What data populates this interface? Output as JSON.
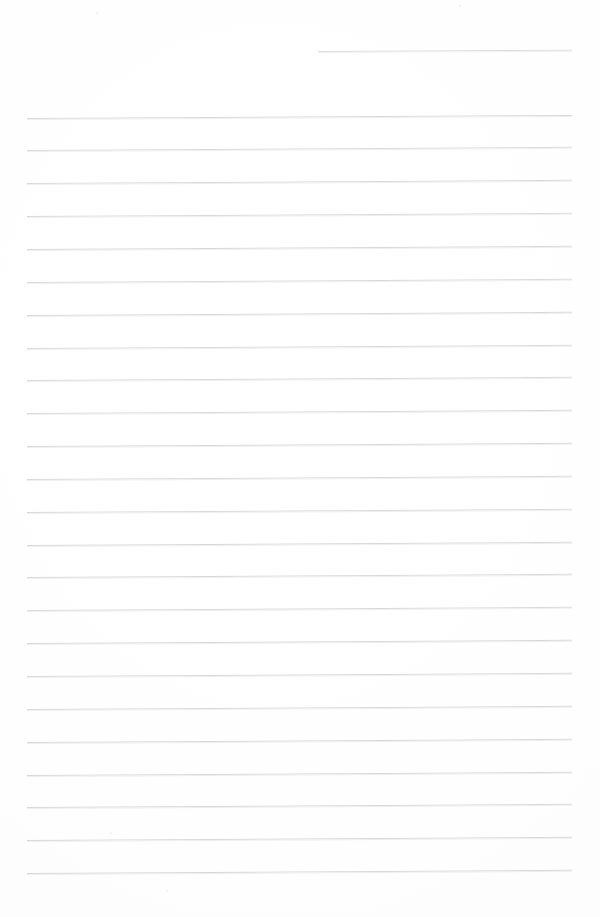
{
  "document": {
    "kind": "scanned-ruled-paper",
    "title": "Blank Ruled Notebook Page",
    "content_text": "",
    "handwriting_present": "no",
    "page_width": 600,
    "page_height": 917,
    "background_color": "#fefefe",
    "rule_color": "#d6d7d9",
    "rule_color_soft": "#eeeef0",
    "rule_thickness_px": 1,
    "rule_spacing_px": 32.85,
    "rule_left_x": 27,
    "rule_right_x": 572,
    "rule_slant_deg": -0.33,
    "full_rule_count": 24,
    "partial_rule_count": 1
  },
  "rules": {
    "partial": [
      {
        "y": 50.5,
        "x": 318,
        "width": 254,
        "slant": -0.3,
        "opacity": 0.85
      }
    ],
    "full": [
      {
        "y": 117.5,
        "x": 27,
        "width": 545,
        "slant": -0.32,
        "opacity": 0.95
      },
      {
        "y": 150.4,
        "x": 27,
        "width": 545,
        "slant": -0.34,
        "opacity": 0.92
      },
      {
        "y": 183.2,
        "x": 27,
        "width": 545,
        "slant": -0.33,
        "opacity": 0.95
      },
      {
        "y": 216.1,
        "x": 27,
        "width": 545,
        "slant": -0.33,
        "opacity": 0.93
      },
      {
        "y": 248.9,
        "x": 27,
        "width": 545,
        "slant": -0.34,
        "opacity": 0.96
      },
      {
        "y": 281.8,
        "x": 27,
        "width": 545,
        "slant": -0.33,
        "opacity": 0.94
      },
      {
        "y": 314.6,
        "x": 27,
        "width": 545,
        "slant": -0.33,
        "opacity": 0.96
      },
      {
        "y": 347.5,
        "x": 27,
        "width": 545,
        "slant": -0.34,
        "opacity": 0.93
      },
      {
        "y": 380.3,
        "x": 27,
        "width": 545,
        "slant": -0.33,
        "opacity": 0.95
      },
      {
        "y": 413.2,
        "x": 27,
        "width": 545,
        "slant": -0.33,
        "opacity": 0.94
      },
      {
        "y": 446.0,
        "x": 27,
        "width": 545,
        "slant": -0.34,
        "opacity": 0.96
      },
      {
        "y": 478.9,
        "x": 27,
        "width": 545,
        "slant": -0.33,
        "opacity": 0.95
      },
      {
        "y": 511.7,
        "x": 27,
        "width": 545,
        "slant": -0.33,
        "opacity": 0.93
      },
      {
        "y": 544.6,
        "x": 27,
        "width": 545,
        "slant": -0.34,
        "opacity": 0.96
      },
      {
        "y": 577.4,
        "x": 27,
        "width": 545,
        "slant": -0.33,
        "opacity": 0.95
      },
      {
        "y": 610.3,
        "x": 27,
        "width": 545,
        "slant": -0.33,
        "opacity": 0.94
      },
      {
        "y": 643.1,
        "x": 27,
        "width": 545,
        "slant": -0.34,
        "opacity": 0.96
      },
      {
        "y": 676.0,
        "x": 27,
        "width": 545,
        "slant": -0.33,
        "opacity": 0.95
      },
      {
        "y": 708.8,
        "x": 27,
        "width": 545,
        "slant": -0.33,
        "opacity": 0.94
      },
      {
        "y": 741.7,
        "x": 27,
        "width": 545,
        "slant": -0.34,
        "opacity": 0.96
      },
      {
        "y": 774.5,
        "x": 27,
        "width": 545,
        "slant": -0.33,
        "opacity": 0.97
      },
      {
        "y": 807.4,
        "x": 27,
        "width": 545,
        "slant": -0.34,
        "opacity": 0.97
      },
      {
        "y": 840.2,
        "x": 27,
        "width": 545,
        "slant": -0.33,
        "opacity": 0.97
      },
      {
        "y": 873.1,
        "x": 27,
        "width": 545,
        "slant": -0.34,
        "opacity": 0.97
      }
    ]
  },
  "artifacts": {
    "specks": [
      {
        "x": 96,
        "y": 12,
        "size": 2
      },
      {
        "x": 459,
        "y": 5,
        "size": 2
      },
      {
        "x": 110,
        "y": 832,
        "size": 2
      },
      {
        "x": 166,
        "y": 890,
        "size": 2
      },
      {
        "x": 307,
        "y": 839,
        "size": 2
      }
    ]
  }
}
